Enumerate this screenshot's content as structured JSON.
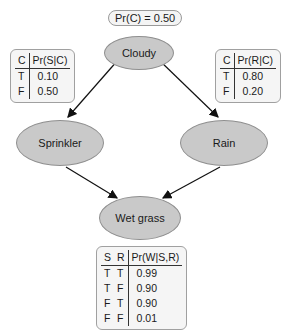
{
  "prior": {
    "label": "Pr(C) = 0.50"
  },
  "nodes": {
    "cloudy": "Cloudy",
    "sprinkler": "Sprinkler",
    "rain": "Rain",
    "wet_grass": "Wet grass"
  },
  "cpt_sprinkler": {
    "headers": [
      "C",
      "Pr(S|C)"
    ],
    "rows": [
      [
        "T",
        "0.10"
      ],
      [
        "F",
        "0.50"
      ]
    ]
  },
  "cpt_rain": {
    "headers": [
      "C",
      "Pr(R|C)"
    ],
    "rows": [
      [
        "T",
        "0.80"
      ],
      [
        "F",
        "0.20"
      ]
    ]
  },
  "cpt_wet_grass": {
    "headers": [
      "S",
      "R",
      "Pr(W|S,R)"
    ],
    "rows": [
      [
        "T",
        "T",
        "0.99"
      ],
      [
        "T",
        "F",
        "0.90"
      ],
      [
        "F",
        "T",
        "0.90"
      ],
      [
        "F",
        "F",
        "0.01"
      ]
    ]
  },
  "edges": [
    [
      "Cloudy",
      "Sprinkler"
    ],
    [
      "Cloudy",
      "Rain"
    ],
    [
      "Sprinkler",
      "Wet grass"
    ],
    [
      "Rain",
      "Wet grass"
    ]
  ]
}
